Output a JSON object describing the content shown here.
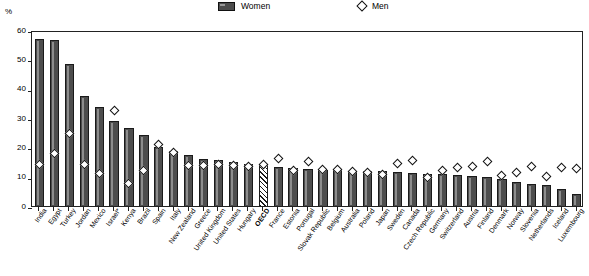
{
  "legend": {
    "women_label": "Women",
    "men_label": "Men",
    "women_icon": "bar-swatch-icon",
    "men_icon": "diamond-marker-icon"
  },
  "axis": {
    "y_unit": "%",
    "yticks": [
      0,
      10,
      20,
      30,
      40,
      50,
      60
    ],
    "ytick_labels": [
      "0",
      "10",
      "20",
      "30",
      "40",
      "50",
      "60"
    ]
  },
  "colors": {
    "bar_fill": "#4d4d4d",
    "bar_stroke": "#1a1a1a",
    "marker_fill": "#ffffff",
    "marker_stroke": "#111111",
    "highlight_bar": "hatched"
  },
  "chart_data": {
    "type": "bar",
    "title": "",
    "xlabel": "",
    "ylabel": "%",
    "ylim": [
      0,
      60
    ],
    "grid": false,
    "legend_position": "top-center",
    "categories": [
      "India",
      "Egypt",
      "Turkey",
      "Jordan",
      "Mexico",
      "Israel*",
      "Kenya",
      "Brazil",
      "Spain",
      "Italy",
      "New Zealand",
      "Greece",
      "United Kingdom",
      "United States",
      "Hungary",
      "OECD",
      "France",
      "Estonia",
      "Portugal",
      "Slovak Republic",
      "Belgium",
      "Australia",
      "Poland",
      "Japan",
      "Sweden",
      "Canada",
      "Czech Republic",
      "Germany",
      "Switzerland",
      "Austria",
      "Finland",
      "Denmark",
      "Norway",
      "Slovenia",
      "Netherlands",
      "Iceland",
      "Luxembourg"
    ],
    "highlight_category": "OECD",
    "series": [
      {
        "name": "Women",
        "marker": "bar",
        "values": [
          57.3,
          56.8,
          48.8,
          38.0,
          34.0,
          29.2,
          26.8,
          24.5,
          20.6,
          19.0,
          17.9,
          16.5,
          16.0,
          15.3,
          14.8,
          14.4,
          13.6,
          13.2,
          12.9,
          12.7,
          12.6,
          12.4,
          12.3,
          12.2,
          11.8,
          11.5,
          11.4,
          11.3,
          10.8,
          10.5,
          10.3,
          9.6,
          8.5,
          7.8,
          7.4,
          6.3,
          4.6
        ]
      },
      {
        "name": "Men",
        "marker": "diamond",
        "values": [
          14.6,
          18.4,
          25.0,
          14.6,
          11.4,
          33.0,
          8.0,
          12.6,
          21.2,
          18.7,
          14.2,
          14.0,
          14.5,
          14.3,
          13.8,
          14.6,
          16.5,
          12.6,
          15.4,
          12.8,
          12.7,
          12.2,
          11.9,
          11.0,
          15.0,
          15.8,
          10.2,
          12.5,
          13.6,
          13.9,
          15.5,
          10.9,
          11.6,
          13.7,
          10.5,
          13.5,
          13.2
        ]
      }
    ]
  }
}
